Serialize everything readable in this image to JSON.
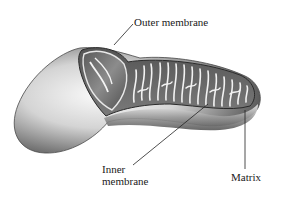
{
  "figure": {
    "labels": {
      "outer": "Outer membrane",
      "inner_line1": "Inner",
      "inner_line2": "membrane",
      "matrix": "Matrix"
    },
    "colors": {
      "background": "#ffffff",
      "ink": "#1a1a1a",
      "shade_dark": "#3a3a3a",
      "shade_mid": "#8a8a8a",
      "shade_light": "#e6e6e6"
    }
  }
}
